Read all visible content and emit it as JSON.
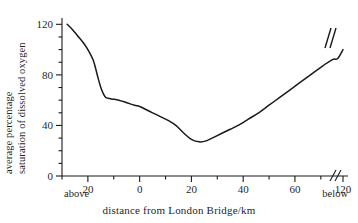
{
  "chart_data": {
    "type": "line",
    "title": "",
    "xlabel": "distance from London Bridge/km",
    "ylabel_line1": "average percentage",
    "ylabel_line2": "saturation of dissolved oxygen",
    "xlim": [
      -30,
      125
    ],
    "ylim": [
      0,
      125
    ],
    "grid": false,
    "legend": null,
    "x_tick_labels": [
      "20",
      "0",
      "20",
      "40",
      "60",
      "120"
    ],
    "x_tick_values": [
      -20,
      0,
      20,
      40,
      60,
      120
    ],
    "x_minor_step": 10,
    "y_tick_labels": [
      "0",
      "40",
      "80",
      "120"
    ],
    "y_tick_values": [
      0,
      40,
      80,
      120
    ],
    "y_minor_step": 10,
    "x_axis_break_note": "//",
    "x_axis_break_between": [
      70,
      120
    ],
    "curve_break_note": "//",
    "left_annotation": "above",
    "right_annotation": "below",
    "series": [
      {
        "name": "average percentage saturation of dissolved oxygen",
        "color": "#1a1a1a",
        "x": [
          -28,
          -26,
          -24,
          -22,
          -20,
          -18,
          -17,
          -16,
          -15,
          -14,
          -13,
          -11,
          -8,
          -5,
          -2,
          0,
          2,
          5,
          8,
          11,
          14,
          17,
          20,
          23,
          26,
          29,
          32,
          35,
          38,
          42,
          46,
          50,
          54,
          58,
          62,
          66,
          70,
          90,
          105,
          120
        ],
        "y": [
          120,
          116,
          111,
          106,
          100,
          92,
          85,
          77,
          70,
          65,
          62,
          61,
          60,
          58,
          56,
          55,
          53,
          50,
          47,
          44,
          40,
          34,
          29,
          27,
          28,
          31,
          34,
          37,
          40,
          45,
          50,
          56,
          62,
          68,
          74,
          80,
          86,
          92,
          93,
          100
        ]
      }
    ]
  },
  "axis": {
    "x_break_symbol": "//",
    "curve_break_symbol": "//"
  }
}
